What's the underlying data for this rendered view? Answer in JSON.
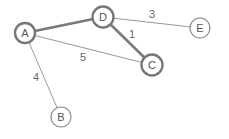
{
  "graph": {
    "nodes": [
      {
        "id": "A",
        "label": "A",
        "x": 25,
        "y": 33,
        "r": 10,
        "highlight": true
      },
      {
        "id": "D",
        "label": "D",
        "x": 103,
        "y": 17,
        "r": 10.5,
        "highlight": true
      },
      {
        "id": "C",
        "label": "C",
        "x": 152,
        "y": 65,
        "r": 10.5,
        "highlight": true
      },
      {
        "id": "E",
        "label": "E",
        "x": 200,
        "y": 28,
        "r": 10,
        "highlight": false
      },
      {
        "id": "B",
        "label": "B",
        "x": 61,
        "y": 117,
        "r": 10,
        "highlight": false
      }
    ],
    "edges": [
      {
        "from": "A",
        "to": "D",
        "weight": "",
        "highlight": true
      },
      {
        "from": "D",
        "to": "C",
        "weight": "1",
        "highlight": true,
        "label_x": 132,
        "label_y": 34
      },
      {
        "from": "D",
        "to": "E",
        "weight": "3",
        "highlight": false,
        "label_x": 152,
        "label_y": 14
      },
      {
        "from": "A",
        "to": "C",
        "weight": "5",
        "highlight": false,
        "label_x": 83,
        "label_y": 57
      },
      {
        "from": "A",
        "to": "B",
        "weight": "4",
        "highlight": false,
        "label_x": 36,
        "label_y": 77
      }
    ]
  },
  "labels": {
    "node_a": "A",
    "node_b": "B",
    "node_c": "C",
    "node_d": "D",
    "node_e": "E",
    "weight_dc": "1",
    "weight_de": "3",
    "weight_ac": "5",
    "weight_ab": "4"
  },
  "colors": {
    "highlight_stroke": "#777777",
    "normal_stroke": "#9a9a9a",
    "text": "#555555",
    "background": "#ffffff"
  }
}
